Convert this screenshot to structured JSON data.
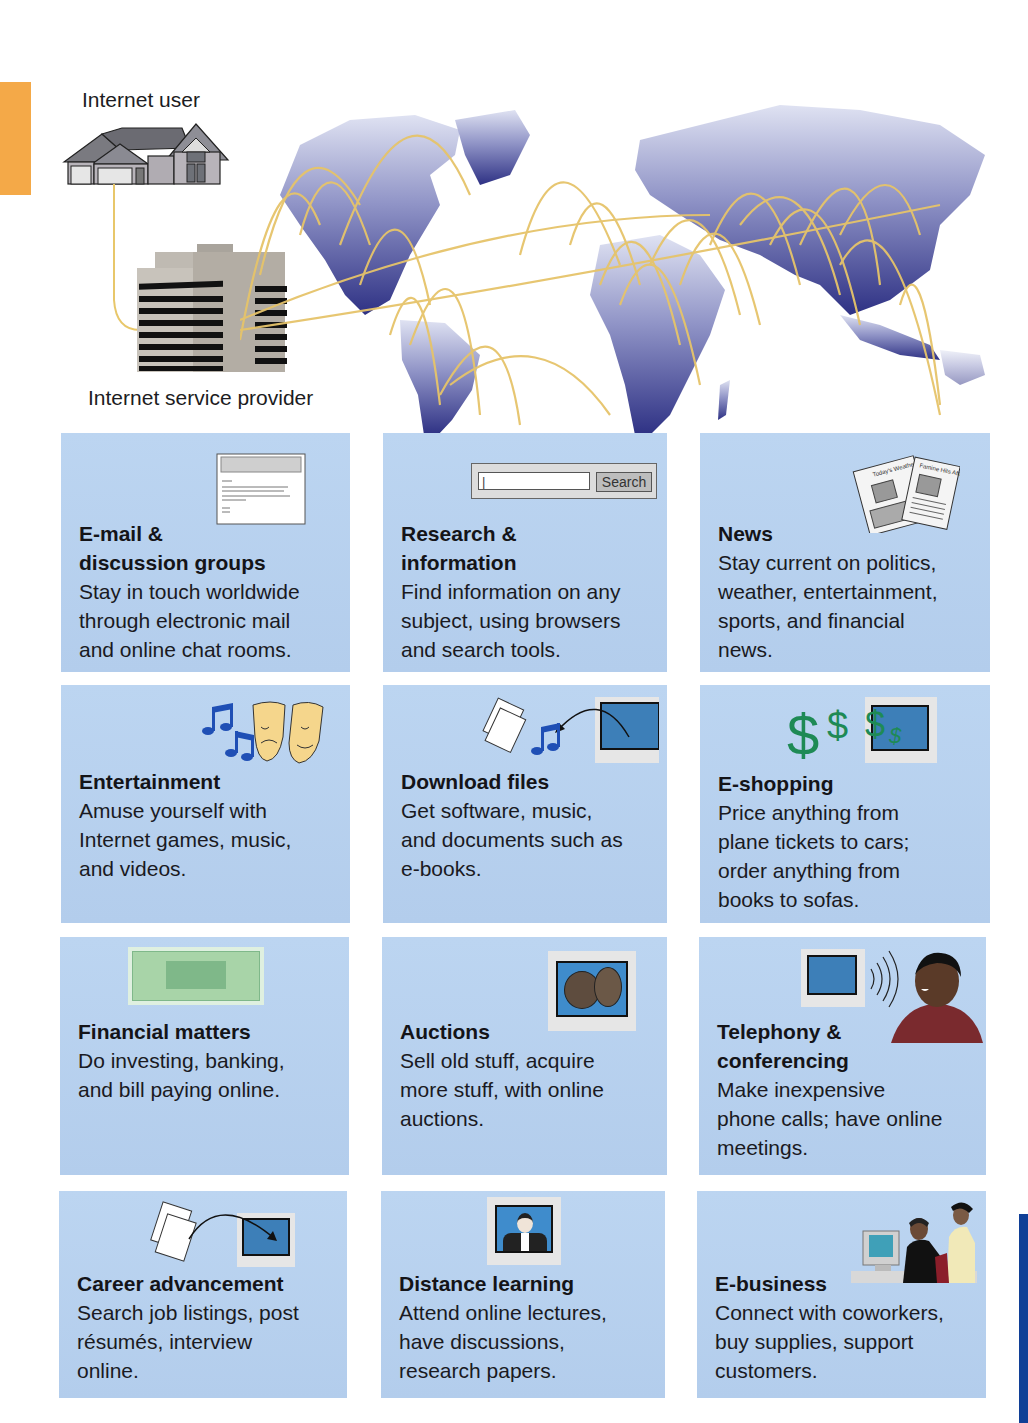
{
  "diagram": {
    "labels": {
      "internet_user": "Internet user",
      "isp": "Internet service provider"
    },
    "colors": {
      "panel_bg": "#b8d2ef",
      "orange_tab": "#f4a948",
      "blue_tab": "#103f96",
      "map_land": "#3d3f8f",
      "connection_lines": "#e8c76a"
    },
    "search_widget": {
      "input_value": "|",
      "button_label": "Search"
    },
    "newspapers": {
      "paper1": "Today's Weather",
      "paper2": "Famine Hits Africa"
    },
    "panels": [
      {
        "title": "E-mail & discussion groups",
        "title_lines": [
          "E-mail &",
          "discussion groups"
        ],
        "desc_lines": [
          "Stay in touch worldwide",
          "through electronic mail",
          "and online chat rooms."
        ],
        "icon": "email-window-icon"
      },
      {
        "title": "Research & information",
        "title_lines": [
          "Research &",
          "information"
        ],
        "desc_lines": [
          "Find information on any",
          "subject, using browsers",
          "and search tools."
        ],
        "icon": "search-box-icon"
      },
      {
        "title": "News",
        "title_lines": [
          "News"
        ],
        "desc_lines": [
          "Stay current on politics,",
          "weather, entertainment,",
          "sports, and financial",
          "news."
        ],
        "icon": "newspaper-icon"
      },
      {
        "title": "Entertainment",
        "title_lines": [
          "Entertainment"
        ],
        "desc_lines": [
          "Amuse yourself with",
          "Internet games, music,",
          "and videos."
        ],
        "icon": "theater-masks-icon"
      },
      {
        "title": "Download files",
        "title_lines": [
          "Download files"
        ],
        "desc_lines": [
          "Get software, music,",
          "and documents such as",
          "e-books."
        ],
        "icon": "download-icon"
      },
      {
        "title": "E-shopping",
        "title_lines": [
          "E-shopping"
        ],
        "desc_lines": [
          "Price anything from",
          "plane tickets to cars;",
          "order anything from",
          "books to sofas."
        ],
        "icon": "dollar-signs-icon"
      },
      {
        "title": "Financial matters",
        "title_lines": [
          "Financial matters"
        ],
        "desc_lines": [
          "Do investing, banking,",
          "and bill paying online."
        ],
        "icon": "banknote-icon"
      },
      {
        "title": "Auctions",
        "title_lines": [
          "Auctions"
        ],
        "desc_lines": [
          "Sell old stuff, acquire",
          "more stuff, with online",
          "auctions."
        ],
        "icon": "coins-icon"
      },
      {
        "title": "Telephony & conferencing",
        "title_lines": [
          "Telephony &",
          "conferencing"
        ],
        "desc_lines": [
          "Make  inexpensive",
          "phone calls; have online",
          "meetings."
        ],
        "icon": "person-talking-icon"
      },
      {
        "title": "Career advancement",
        "title_lines": [
          "Career advancement"
        ],
        "desc_lines": [
          "Search job listings, post",
          "résumés, interview",
          "online."
        ],
        "icon": "upload-resume-icon"
      },
      {
        "title": "Distance learning",
        "title_lines": [
          "Distance learning"
        ],
        "desc_lines": [
          "Attend online lectures,",
          "have discussions,",
          "research papers."
        ],
        "icon": "lecturer-screen-icon"
      },
      {
        "title": "E-business",
        "title_lines": [
          "E-business"
        ],
        "desc_lines": [
          "Connect with coworkers,",
          "buy supplies, support",
          "customers."
        ],
        "icon": "office-workers-icon"
      }
    ]
  }
}
